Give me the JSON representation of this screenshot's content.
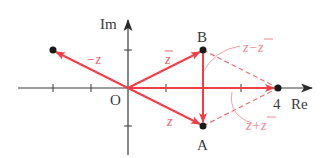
{
  "diagram": {
    "type": "complex-plane",
    "axes": {
      "real_label": "Re",
      "imag_label": "Im",
      "origin_label": "O",
      "tick_label_4": "4"
    },
    "points": {
      "B": {
        "label": "B",
        "value": "2+i"
      },
      "A": {
        "label": "A",
        "value": "2-i"
      },
      "neg_z": {
        "label": "",
        "value": "-2+i"
      },
      "sum": {
        "label": "4",
        "value": "4"
      }
    },
    "vectors": {
      "z": "z",
      "z_conj": "z",
      "neg_z": "−z",
      "diff": "z−z",
      "sum": "z+z"
    },
    "colors": {
      "axis": "#3a3a3a",
      "vector": "#ee3f48",
      "dashed": "#ef6f76",
      "label_red": "#e8646a",
      "point": "#1a1a1a"
    }
  }
}
